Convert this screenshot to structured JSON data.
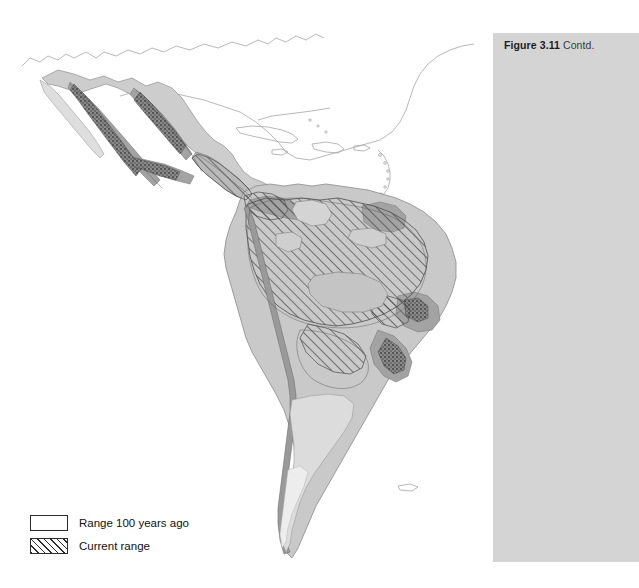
{
  "figure": {
    "number_label": "Figure 3.11",
    "continuation_label": "Contd.",
    "panel_color": "#d4d4d4"
  },
  "map": {
    "name": "species-distribution-map-americas",
    "region": "Latin America (Mexico, Central America, South America)",
    "background_color": "#ffffff",
    "ocean_color": "#ffffff",
    "land_outline_color": "#8c8c8c",
    "historical_range_color": "#c9c9c9",
    "core_range_color": "#9d9d9d",
    "dense_range_color": "#6e6e6e",
    "hatch_color": "#555555"
  },
  "legend": {
    "name": "map-legend",
    "items": [
      {
        "label": "Range 100 years ago",
        "swatch": "outline",
        "fill": "#ffffff",
        "border": "#2b2b2b"
      },
      {
        "label": "Current range",
        "swatch": "hatched",
        "fill": "#ffffff",
        "border": "#2b2b2b"
      }
    ]
  }
}
